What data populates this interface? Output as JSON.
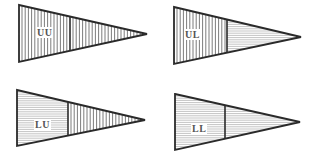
{
  "diagram": {
    "type": "pennant-pattern-grid",
    "colors": {
      "stroke": "#2a2a2a",
      "hatch": "#444444",
      "background": "#ffffff"
    },
    "flags": [
      {
        "id": "uu",
        "label": "UU",
        "left_pattern": "vertical",
        "right_pattern": "vertical",
        "geom": {
          "x0": 19,
          "ytop": 5,
          "ybot": 62,
          "tipx": 147,
          "tipy": 34,
          "divx": 70
        },
        "label_pos": {
          "x": 36,
          "y": 27
        }
      },
      {
        "id": "ul",
        "label": "UL",
        "left_pattern": "vertical",
        "right_pattern": "horizontal",
        "geom": {
          "x0": 174,
          "ytop": 7,
          "ybot": 64,
          "tipx": 301,
          "tipy": 37,
          "divx": 227
        },
        "label_pos": {
          "x": 184,
          "y": 29
        }
      },
      {
        "id": "lu",
        "label": "LU",
        "left_pattern": "horizontal",
        "right_pattern": "vertical",
        "geom": {
          "x0": 17,
          "ytop": 90,
          "ybot": 146,
          "tipx": 145,
          "tipy": 120,
          "divx": 68
        },
        "label_pos": {
          "x": 34,
          "y": 119
        }
      },
      {
        "id": "ll",
        "label": "LL",
        "left_pattern": "horizontal",
        "right_pattern": "horizontal",
        "geom": {
          "x0": 175,
          "ytop": 94,
          "ybot": 150,
          "tipx": 300,
          "tipy": 122,
          "divx": 225
        },
        "label_pos": {
          "x": 191,
          "y": 123
        }
      }
    ]
  }
}
